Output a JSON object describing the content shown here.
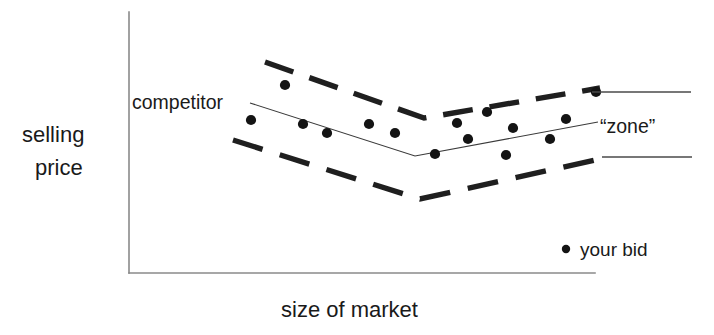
{
  "figure": {
    "axes": {
      "y_label_line1": "selling",
      "y_label_line2": "price",
      "x_label": "size of market"
    },
    "annotations": {
      "competitor": "competitor",
      "zone": "“zone”"
    },
    "legend": {
      "marker": "dot-marker-icon",
      "label": "your bid"
    },
    "colors": {
      "axis": "#8a8a8a",
      "band": "#1f1f1f",
      "trend": "#3a3a3a",
      "dot": "#141414",
      "bracket": "#4a4a4a",
      "background": "#ffffff"
    }
  },
  "chart_data": {
    "type": "scatter",
    "title": "",
    "xlabel": "size of market",
    "ylabel": "selling price",
    "grid": false,
    "legend_position": "bottom-right",
    "axis_pixel_frame": {
      "x_axis_y": 273,
      "y_axis_x": 129,
      "y_axis_top": 12,
      "x_axis_right": 595,
      "note": "unlabeled qualitative axes; values expressed in pixel coordinates"
    },
    "series": [
      {
        "name": "your bid",
        "type": "scatter",
        "marker": "filled-circle",
        "points": [
          {
            "x": 251,
            "y": 120
          },
          {
            "x": 285,
            "y": 85
          },
          {
            "x": 303,
            "y": 124
          },
          {
            "x": 327,
            "y": 133
          },
          {
            "x": 369,
            "y": 124
          },
          {
            "x": 395,
            "y": 133
          },
          {
            "x": 435,
            "y": 154
          },
          {
            "x": 457,
            "y": 123
          },
          {
            "x": 468,
            "y": 139
          },
          {
            "x": 487,
            "y": 112
          },
          {
            "x": 506,
            "y": 155
          },
          {
            "x": 513,
            "y": 128
          },
          {
            "x": 550,
            "y": 139
          },
          {
            "x": 566,
            "y": 119
          },
          {
            "x": 596,
            "y": 92
          }
        ]
      },
      {
        "name": "competitor",
        "type": "line",
        "style": "thin-solid",
        "vertices": [
          {
            "x": 250,
            "y": 103
          },
          {
            "x": 415,
            "y": 156
          },
          {
            "x": 598,
            "y": 122
          }
        ]
      },
      {
        "name": "zone upper bound",
        "type": "line",
        "style": "heavy-dashed",
        "vertices": [
          {
            "x": 265,
            "y": 62
          },
          {
            "x": 424,
            "y": 118
          },
          {
            "x": 600,
            "y": 88
          }
        ]
      },
      {
        "name": "zone lower bound",
        "type": "line",
        "style": "heavy-dashed",
        "vertices": [
          {
            "x": 233,
            "y": 140
          },
          {
            "x": 420,
            "y": 199
          },
          {
            "x": 604,
            "y": 158
          }
        ]
      }
    ],
    "brackets": [
      {
        "name": "zone upper marker",
        "x1": 592,
        "x2": 691,
        "y": 92
      },
      {
        "name": "zone lower marker",
        "x1": 602,
        "x2": 692,
        "y": 157
      }
    ]
  }
}
